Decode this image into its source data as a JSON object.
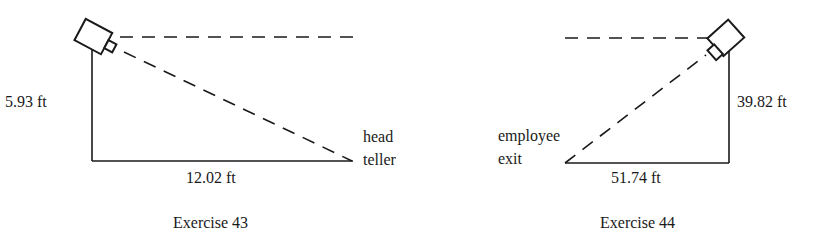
{
  "figures": [
    {
      "caption": "Exercise 43",
      "vertical_label": "5.93 ft",
      "horizontal_label": "12.02 ft",
      "target_label_line1": "head",
      "target_label_line2": "teller",
      "icon": "security-camera-icon"
    },
    {
      "caption": "Exercise 44",
      "vertical_label": "39.82 ft",
      "horizontal_label": "51.74 ft",
      "target_label_line1": "employee",
      "target_label_line2": "exit",
      "icon": "security-camera-icon"
    }
  ],
  "colors": {
    "ink": "#1a1a1a",
    "background": "#ffffff"
  }
}
